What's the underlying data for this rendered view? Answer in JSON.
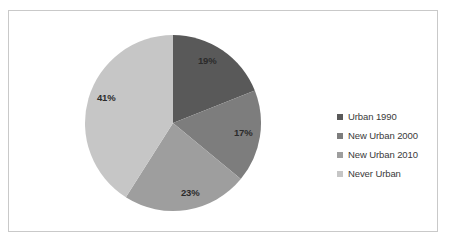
{
  "chart_data": {
    "type": "pie",
    "title": "",
    "categories": [
      "Urban 1990",
      "New Urban 2000",
      "New Urban 2010",
      "Never Urban"
    ],
    "values": [
      19,
      17,
      23,
      41
    ],
    "data_labels": [
      "19%",
      "17%",
      "23%",
      "41%"
    ],
    "colors": [
      "#595959",
      "#7d7d7d",
      "#9e9e9e",
      "#c6c6c6"
    ],
    "legend_position": "right",
    "grid": false,
    "start_angle_deg": 0,
    "direction": "clockwise",
    "units": "percent"
  },
  "legend": {
    "items": [
      {
        "label": "Urban 1990",
        "color": "#595959",
        "marker": "square-marker-icon"
      },
      {
        "label": "New Urban 2000",
        "color": "#7d7d7d",
        "marker": "square-marker-icon"
      },
      {
        "label": "New Urban 2010",
        "color": "#9e9e9e",
        "marker": "square-marker-icon"
      },
      {
        "label": "Never Urban",
        "color": "#c6c6c6",
        "marker": "square-marker-icon"
      }
    ]
  },
  "frame": {
    "border_color": "#c9c9c9",
    "background": "#ffffff"
  }
}
